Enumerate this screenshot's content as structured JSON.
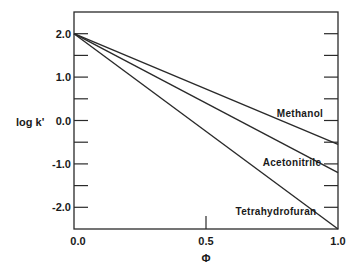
{
  "chart_data": {
    "type": "line",
    "title": "",
    "xlabel": "Φ",
    "ylabel": "log k'",
    "xlim": [
      0.0,
      1.0
    ],
    "ylim": [
      -2.5,
      2.5
    ],
    "grid": false,
    "legend": "inline labels at line ends",
    "x_ticks": [
      {
        "value": 0.0,
        "label": "0.0"
      },
      {
        "value": 0.5,
        "label": "0.5"
      },
      {
        "value": 1.0,
        "label": "1.0"
      }
    ],
    "y_ticks_labeled": [
      {
        "value": 2.0,
        "label": "2.0"
      },
      {
        "value": 1.0,
        "label": "1.0"
      },
      {
        "value": 0.0,
        "label": "0.0"
      },
      {
        "value": -1.0,
        "label": "-1.0"
      },
      {
        "value": -2.0,
        "label": "-2.0"
      }
    ],
    "y_ticks_minor": [
      1.5,
      0.5,
      -0.5,
      -1.5
    ],
    "x": [
      0.0,
      1.0
    ],
    "series": [
      {
        "name": "Methanol",
        "values": [
          2.0,
          -0.55
        ]
      },
      {
        "name": "Acetonitrile",
        "values": [
          2.0,
          -1.2
        ]
      },
      {
        "name": "Tetrahydrofuran",
        "values": [
          2.0,
          -2.5
        ]
      }
    ]
  },
  "labels": {
    "ylabel": "log k'",
    "xlabel": "Φ",
    "series": [
      "Methanol",
      "Acetonitrile",
      "Tetrahydrofuran"
    ]
  }
}
